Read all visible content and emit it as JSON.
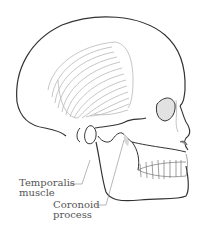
{
  "figure": {
    "labels": [
      {
        "id": "temporalis",
        "lines": [
          "Temporalis",
          "muscle"
        ]
      },
      {
        "id": "coronoid",
        "lines": [
          "Coronoid",
          "process"
        ]
      }
    ],
    "colors": {
      "outline": "#333333",
      "muscle_lines": "#b8b8b8",
      "label_text": "#555555",
      "leader_line": "#888888",
      "shading": "#d8d8d8",
      "background": "#ffffff"
    }
  }
}
